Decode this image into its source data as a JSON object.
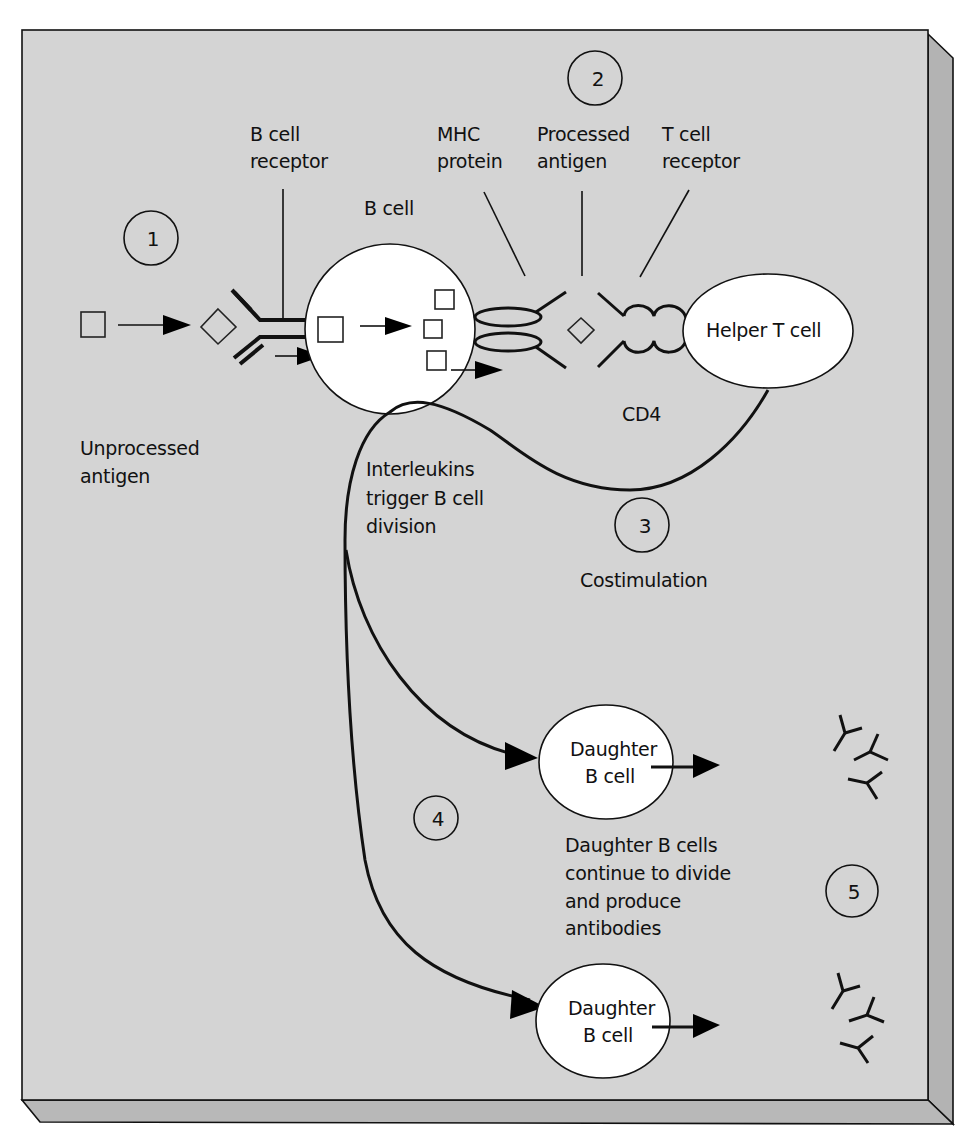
{
  "figure": {
    "background_color": "#d4d4d4",
    "frame_side_color": "#b3b3b3",
    "line_color": "#111111",
    "cell_fill": "#ffffff"
  },
  "steps": [
    {
      "number": "1"
    },
    {
      "number": "2"
    },
    {
      "number": "3"
    },
    {
      "number": "4"
    },
    {
      "number": "5"
    }
  ],
  "labels": {
    "b_cell_receptor": [
      "B cell",
      "receptor"
    ],
    "b_cell": "B cell",
    "mhc_protein": [
      "MHC",
      "protein"
    ],
    "processed_antigen": [
      "Processed",
      "antigen"
    ],
    "t_cell_receptor": [
      "T cell",
      "receptor"
    ],
    "helper_t_cell": "Helper T cell",
    "unprocessed_antigen": [
      "Unprocessed",
      "antigen"
    ],
    "cd4": "CD4",
    "interleukins": [
      "Interleukins",
      "trigger B cell",
      "division"
    ],
    "costimulation": "Costimulation",
    "daughter_b_cell_1": [
      "Daughter",
      "B cell"
    ],
    "daughter_b_cell_2": [
      "Daughter",
      "B cell"
    ],
    "daughter_note": [
      "Daughter B cells",
      "continue to divide",
      "and produce",
      "antibodies"
    ]
  },
  "icons": {
    "antigen": "square-icon",
    "processed_antigen": "diamond-icon",
    "antibody": "y-shape-icon"
  }
}
